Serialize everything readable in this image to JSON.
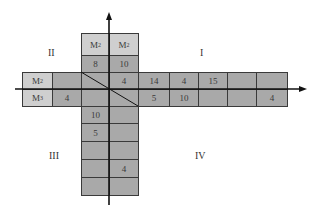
{
  "quadrants": [
    {
      "label": "I",
      "x": 200,
      "y": 47
    },
    {
      "label": "II",
      "x": 48,
      "y": 47
    },
    {
      "label": "III",
      "x": 49,
      "y": 150
    },
    {
      "label": "IV",
      "x": 195,
      "y": 150
    }
  ],
  "axes": {
    "origin": [
      109,
      89
    ],
    "x_arrow_end": 307,
    "x_start": 15,
    "y_arrow_end": 12,
    "y_start": 205
  },
  "vertical_strip": {
    "x_left": 81,
    "x_mid": 109,
    "x_right": 138,
    "top_rows": [
      {
        "y": 33,
        "h": 22,
        "style": "light",
        "left": {
          "text": "M",
          "sub": "2"
        },
        "right": {
          "text": "M",
          "sub": "2"
        }
      },
      {
        "y": 55,
        "h": 17,
        "style": "dark",
        "left": {
          "text": "8"
        },
        "right": {
          "text": "10"
        }
      }
    ],
    "bottom_rows": [
      {
        "y": 106,
        "h": 17,
        "left": "10",
        "right": ""
      },
      {
        "y": 123,
        "h": 18,
        "left": "5",
        "right": ""
      },
      {
        "y": 141,
        "h": 18,
        "left": "",
        "right": ""
      },
      {
        "y": 159,
        "h": 18,
        "left": "",
        "right": "4"
      },
      {
        "y": 177,
        "h": 18,
        "left": "",
        "right": ""
      }
    ]
  },
  "horizontal_strip": {
    "y_top": 72,
    "y_mid": 89,
    "y_bottom": 106,
    "left_cols": [
      {
        "x": 22,
        "w": 30,
        "style": "light",
        "top": {
          "text": "M",
          "sub": "2"
        },
        "bottom": {
          "text": "M",
          "sub": "3"
        }
      },
      {
        "x": 52,
        "w": 29,
        "style": "dark",
        "top": {
          "text": ""
        },
        "bottom": {
          "text": "4"
        }
      }
    ],
    "center": {
      "top_left": "",
      "top_right": "4",
      "bottom_left": "",
      "bottom_right": ""
    },
    "right_cols": [
      {
        "x": 138,
        "w": 31,
        "top": "14",
        "bottom": "5"
      },
      {
        "x": 169,
        "w": 29,
        "top": "4",
        "bottom": "10"
      },
      {
        "x": 198,
        "w": 29,
        "top": "15",
        "bottom": ""
      },
      {
        "x": 227,
        "w": 29,
        "top": "",
        "bottom": ""
      },
      {
        "x": 256,
        "w": 31,
        "top": "",
        "bottom": "4"
      }
    ]
  },
  "diagonal": {
    "x1": 81,
    "y1": 72,
    "x2": 138,
    "y2": 106
  }
}
